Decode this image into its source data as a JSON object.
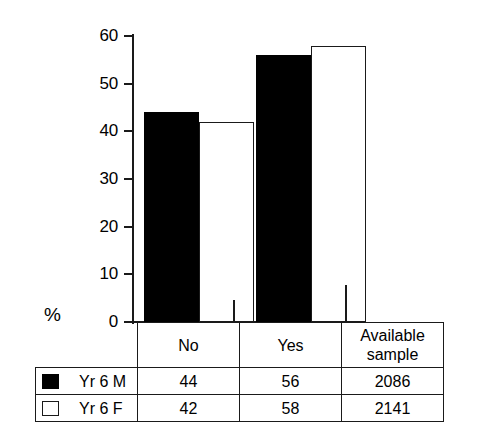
{
  "axis": {
    "ylabel": "%",
    "ticks": [
      "60",
      "50",
      "40",
      "30",
      "20",
      "10",
      "0"
    ],
    "ymin": 0,
    "ymax": 60
  },
  "table": {
    "header": {
      "blank": "",
      "categories": [
        "No",
        "Yes"
      ],
      "available_line1": "Available",
      "available_line2": "sample"
    },
    "rows": [
      {
        "swatch": "solid-black-swatch",
        "label": "Yr 6 M",
        "no": "44",
        "yes": "56",
        "available": "2086"
      },
      {
        "swatch": "hollow-white-swatch",
        "label": "Yr 6 F",
        "no": "42",
        "yes": "58",
        "available": "2141"
      }
    ]
  },
  "colors": {
    "series_male": "#000000",
    "series_female": "#ffffff",
    "ink": "#1a1a1a",
    "background": "#ffffff"
  },
  "chart_data": {
    "type": "bar",
    "title": "",
    "subtitle": "",
    "xlabel": "",
    "ylabel": "%",
    "categories": [
      "No",
      "Yes"
    ],
    "series": [
      {
        "name": "Yr 6 M",
        "values": [
          44,
          56
        ],
        "color": "#000000",
        "fill": "solid",
        "available_sample": 2086
      },
      {
        "name": "Yr 6 F",
        "values": [
          42,
          58
        ],
        "color": "#ffffff",
        "fill": "hollow",
        "available_sample": 2141
      }
    ],
    "ylim": [
      0,
      60
    ],
    "yticks": [
      0,
      10,
      20,
      30,
      40,
      50,
      60
    ],
    "grid": false,
    "legend_position": "table-below"
  }
}
